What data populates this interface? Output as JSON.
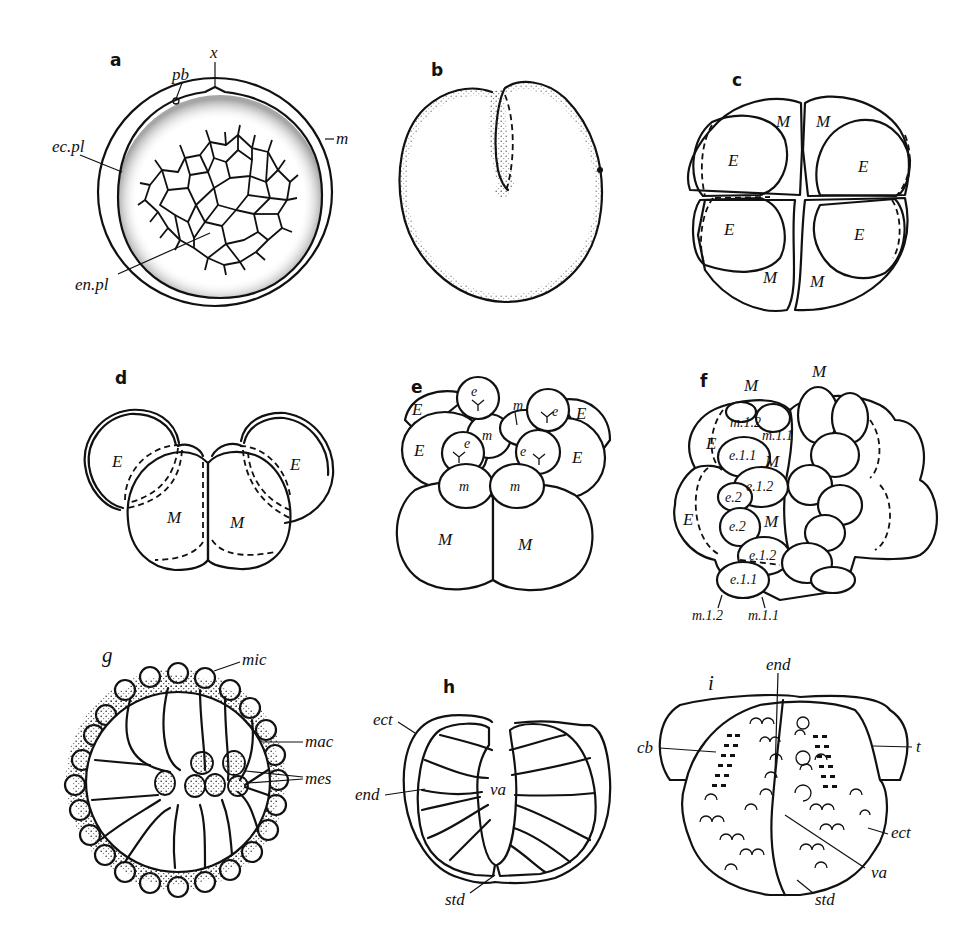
{
  "figure": {
    "panels": {
      "a": {
        "letter": "a",
        "labels": {
          "pb": "pb",
          "x": "x",
          "ec_pl": "ec.pl",
          "m": "m",
          "en_pl": "en.pl"
        }
      },
      "b": {
        "letter": "b"
      },
      "c": {
        "letter": "c",
        "labels": {
          "M": "M",
          "E": "E"
        }
      },
      "d": {
        "letter": "d",
        "labels": {
          "M": "M",
          "E": "E"
        }
      },
      "e": {
        "letter": "e",
        "labels": {
          "M": "M",
          "E": "E",
          "m": "m",
          "e": "e"
        }
      },
      "f": {
        "letter": "f",
        "labels": {
          "M": "M",
          "E": "E",
          "m_1_2": "m.1.2",
          "m_1_1": "m.1.1",
          "e_1_1": "e.1.1",
          "e_1_2": "e.1.2",
          "e_2": "e.2"
        }
      },
      "g": {
        "letter": "g",
        "labels": {
          "mic": "mic",
          "mac": "mac",
          "mes": "mes"
        }
      },
      "h": {
        "letter": "h",
        "labels": {
          "ect": "ect",
          "end": "end",
          "va": "va",
          "std": "std"
        }
      },
      "i": {
        "letter": "i",
        "labels": {
          "end": "end",
          "cb": "cb",
          "t": "t",
          "ect": "ect",
          "va": "va",
          "std": "std"
        }
      }
    }
  }
}
